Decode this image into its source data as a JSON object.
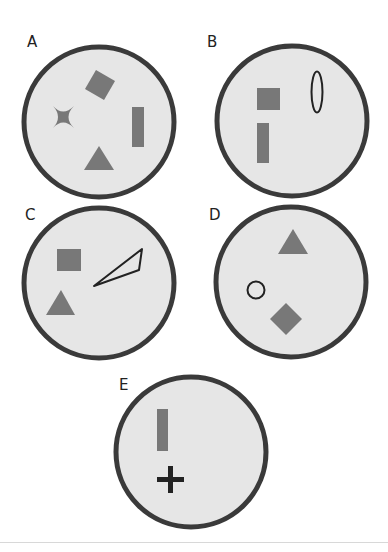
{
  "colors": {
    "circle_fill": "#e6e6e6",
    "circle_stroke": "#3a3a3a",
    "shape_fill": "#787878",
    "outline_stroke": "#222222",
    "divider": "#d8d8d8"
  },
  "panels": [
    {
      "label": "A",
      "shapes": [
        "rotated-square",
        "concave-star",
        "vertical-rectangle",
        "triangle"
      ]
    },
    {
      "label": "B",
      "shapes": [
        "square",
        "vertical-rectangle",
        "ellipse-outline"
      ]
    },
    {
      "label": "C",
      "shapes": [
        "square",
        "triangle",
        "thin-triangle-outline"
      ]
    },
    {
      "label": "D",
      "shapes": [
        "triangle",
        "circle-outline",
        "diamond"
      ]
    },
    {
      "label": "E",
      "shapes": [
        "vertical-rectangle",
        "plus-sign"
      ]
    }
  ]
}
